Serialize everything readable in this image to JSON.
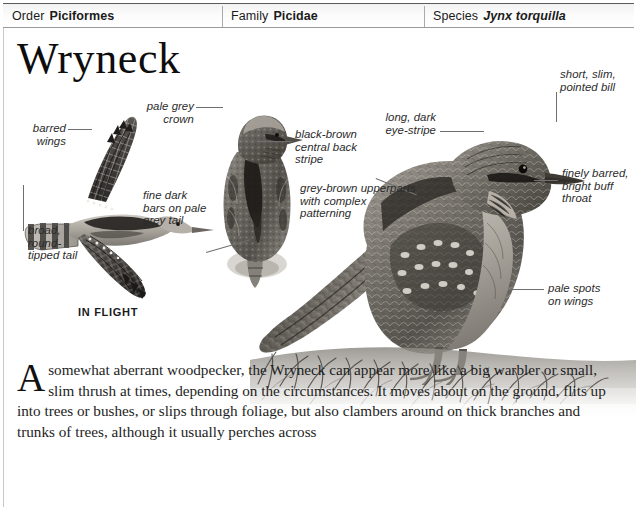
{
  "taxonomy": [
    {
      "key": "Order",
      "value": "Piciformes",
      "italic": false
    },
    {
      "key": "Family",
      "value": "Picidae",
      "italic": false
    },
    {
      "key": "Species",
      "value": "Jynx torquilla",
      "italic": true
    }
  ],
  "page_title": "Wryneck",
  "annotations": [
    {
      "id": "barred-wings",
      "text": "barred\nwings"
    },
    {
      "id": "broad-round-tipped-tail",
      "text": "broad,\nround-\ntipped tail"
    },
    {
      "id": "pale-grey-crown",
      "text": "pale grey\ncrown"
    },
    {
      "id": "fine-dark-bars-on-pale-grey-tail",
      "text": "fine dark\nbars on pale\ngrey tail"
    },
    {
      "id": "black-brown-central-back-stripe",
      "text": "black-brown\ncentral back\nstripe"
    },
    {
      "id": "grey-brown-upperparts",
      "text": "grey-brown upperparts\nwith complex\npatterning"
    },
    {
      "id": "long-dark-eye-stripe",
      "text": "long, dark\neye-stripe"
    },
    {
      "id": "short-slim-pointed-bill",
      "text": "short, slim,\npointed bill"
    },
    {
      "id": "finely-barred-bright-buff-throat",
      "text": "finely barred,\nbright buff\nthroat"
    },
    {
      "id": "pale-spots-on-wings",
      "text": "pale spots\non wings"
    }
  ],
  "in_flight_caption": "IN FLIGHT",
  "body_text": {
    "dropcap": "A",
    "paragraph": "somewhat aberrant woodpecker, the Wryneck can appear more like a big warbler or small, slim thrush at times, depending on the circumstances. It moves about on the ground, flits up into trees or bushes, or slips through foliage, but also clambers around on thick branches and trunks of trees, although it usually perches across"
  },
  "colors": {
    "header_border": "#5a5a5a",
    "annotation_text": "#2b2b2b",
    "leader_line": "#6f6f6f",
    "body_text": "#1d1d1d"
  },
  "figures": [
    {
      "id": "wryneck-in-flight",
      "caption": "IN FLIGHT"
    },
    {
      "id": "wryneck-perched-front"
    },
    {
      "id": "wryneck-perched-side"
    }
  ]
}
